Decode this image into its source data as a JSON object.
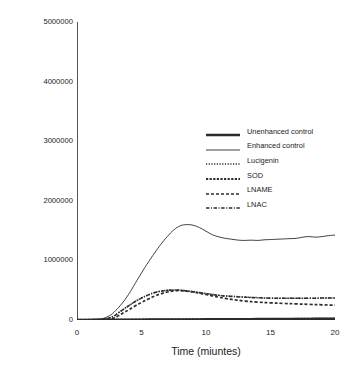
{
  "chart_data": {
    "type": "line",
    "title": "",
    "xlabel": "Time (miuntes)",
    "ylabel": "Chemiluminescence (Relative Light Units)",
    "xlim": [
      0,
      20
    ],
    "ylim": [
      0,
      5000000
    ],
    "xticks": [
      "0",
      "5",
      "10",
      "15",
      "20"
    ],
    "xtick_values": [
      0,
      5,
      10,
      15,
      20
    ],
    "yticks": [
      "0",
      "1000000",
      "2000000",
      "3000000",
      "4000000",
      "5000000"
    ],
    "ytick_values": [
      0,
      1000000,
      2000000,
      3000000,
      4000000,
      5000000
    ],
    "grid": false,
    "legend_position": "center-right",
    "axis_color": "#555555",
    "line_color": "#2b2b2b",
    "series": [
      {
        "name": "Unenhanced control",
        "style": "solid-thick",
        "x": [
          0,
          1,
          2,
          3,
          4,
          5,
          6,
          7,
          8,
          9,
          10,
          11,
          12,
          13,
          14,
          15,
          16,
          17,
          18,
          19,
          20
        ],
        "values": [
          0,
          1000,
          2000,
          3000,
          4000,
          5000,
          6000,
          7000,
          8000,
          9000,
          10000,
          11000,
          12000,
          13000,
          14000,
          15000,
          16000,
          17000,
          18000,
          19000,
          20000
        ]
      },
      {
        "name": "Enhanced control",
        "style": "solid-thin",
        "x": [
          0,
          1,
          1.8,
          2.5,
          3,
          3.5,
          4,
          4.5,
          5,
          5.5,
          6,
          6.5,
          7,
          7.5,
          8,
          8.5,
          9,
          9.5,
          10,
          10.5,
          11,
          11.5,
          12,
          12.5,
          13,
          13.5,
          14,
          14.5,
          15,
          15.5,
          16,
          16.5,
          17,
          17.5,
          18,
          18.5,
          19,
          19.5,
          20
        ],
        "values": [
          5000,
          8000,
          15000,
          70000,
          160000,
          280000,
          430000,
          610000,
          790000,
          960000,
          1120000,
          1270000,
          1400000,
          1510000,
          1580000,
          1600000,
          1590000,
          1550000,
          1490000,
          1430000,
          1395000,
          1370000,
          1355000,
          1340000,
          1335000,
          1340000,
          1335000,
          1345000,
          1350000,
          1355000,
          1360000,
          1365000,
          1370000,
          1390000,
          1400000,
          1390000,
          1400000,
          1415000,
          1425000
        ]
      },
      {
        "name": "Lucigenin",
        "style": "dotted",
        "x": [
          0,
          1,
          2,
          2.8,
          3.2,
          3.6,
          4,
          4.5,
          5,
          5.5,
          6,
          6.5,
          7,
          7.5,
          8,
          8.5,
          9,
          9.5,
          10,
          10.5,
          11,
          11.5,
          12,
          13,
          14,
          15,
          16,
          17,
          18,
          19,
          20
        ],
        "values": [
          3000,
          5000,
          10000,
          60000,
          120000,
          180000,
          240000,
          310000,
          370000,
          420000,
          460000,
          485000,
          500000,
          505000,
          500000,
          490000,
          475000,
          460000,
          445000,
          430000,
          415000,
          405000,
          398000,
          385000,
          375000,
          368000,
          365000,
          363000,
          365000,
          368000,
          370000
        ]
      },
      {
        "name": "SOD",
        "style": "dashed-dense",
        "x": [
          0,
          2,
          4,
          6,
          8,
          10,
          12,
          14,
          16,
          18,
          20
        ],
        "values": [
          2000,
          4000,
          6000,
          8000,
          10000,
          12000,
          14000,
          16000,
          18000,
          20000,
          22000
        ]
      },
      {
        "name": "LNAME",
        "style": "dashed",
        "x": [
          0,
          1,
          2,
          2.8,
          3.2,
          3.6,
          4,
          4.5,
          5,
          5.5,
          6,
          6.5,
          7,
          7.5,
          8,
          8.5,
          9,
          9.5,
          10,
          10.5,
          11,
          11.5,
          12,
          13,
          14,
          15,
          16,
          17,
          18,
          19,
          20
        ],
        "values": [
          3000,
          5000,
          9000,
          30000,
          70000,
          120000,
          170000,
          235000,
          295000,
          350000,
          400000,
          440000,
          470000,
          488000,
          492000,
          485000,
          470000,
          450000,
          428000,
          405000,
          382000,
          362000,
          345000,
          318000,
          300000,
          288000,
          278000,
          270000,
          262000,
          255000,
          248000
        ]
      },
      {
        "name": "LNAC",
        "style": "dash-dot",
        "x": [
          0,
          1,
          2,
          2.8,
          3.2,
          3.6,
          4,
          4.5,
          5,
          5.5,
          6,
          6.5,
          7,
          7.5,
          8,
          8.5,
          9,
          9.5,
          10,
          11,
          12,
          14,
          16,
          18,
          20
        ],
        "values": [
          3000,
          5000,
          10000,
          58000,
          118000,
          178000,
          238000,
          308000,
          368000,
          418000,
          458000,
          483000,
          498000,
          503000,
          498000,
          488000,
          473000,
          458000,
          443000,
          413000,
          396000,
          373000,
          364000,
          366000,
          369000
        ]
      }
    ]
  },
  "legend": {
    "items": [
      {
        "label": "Unenhanced control",
        "style": "solid-thick"
      },
      {
        "label": "Enhanced control",
        "style": "solid-thin"
      },
      {
        "label": "Lucigenin",
        "style": "dotted"
      },
      {
        "label": "SOD",
        "style": "dashed-dense"
      },
      {
        "label": "LNAME",
        "style": "dashed"
      },
      {
        "label": "LNAC",
        "style": "dash-dot"
      }
    ]
  }
}
